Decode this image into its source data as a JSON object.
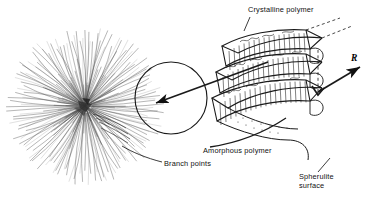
{
  "figure": {
    "background_color": "#ffffff",
    "ink_color": "#1a1a1a"
  },
  "labels": {
    "crystalline": "Crystalline polymer",
    "amorphous": "Amorphous polymer",
    "branch_points": "Branch points",
    "spherulite_surface_line1": "Spherulite",
    "spherulite_surface_line2": "surface",
    "radius_symbol": "R"
  },
  "diagram": {
    "spherulite": {
      "center_x": 85,
      "center_y": 106,
      "radius": 78,
      "fibril_count": 150,
      "description": "radiating fibrillar spherulite"
    },
    "magnifier_circle": {
      "center_x": 171,
      "center_y": 98,
      "radius": 36
    },
    "callout_arrow": {
      "from_x": 268,
      "from_y": 62,
      "to_x": 152,
      "to_y": 104
    },
    "radius_arrow": {
      "from_x": 318,
      "from_y": 92,
      "to_x": 362,
      "to_y": 66
    },
    "lamella_layers": 3
  }
}
